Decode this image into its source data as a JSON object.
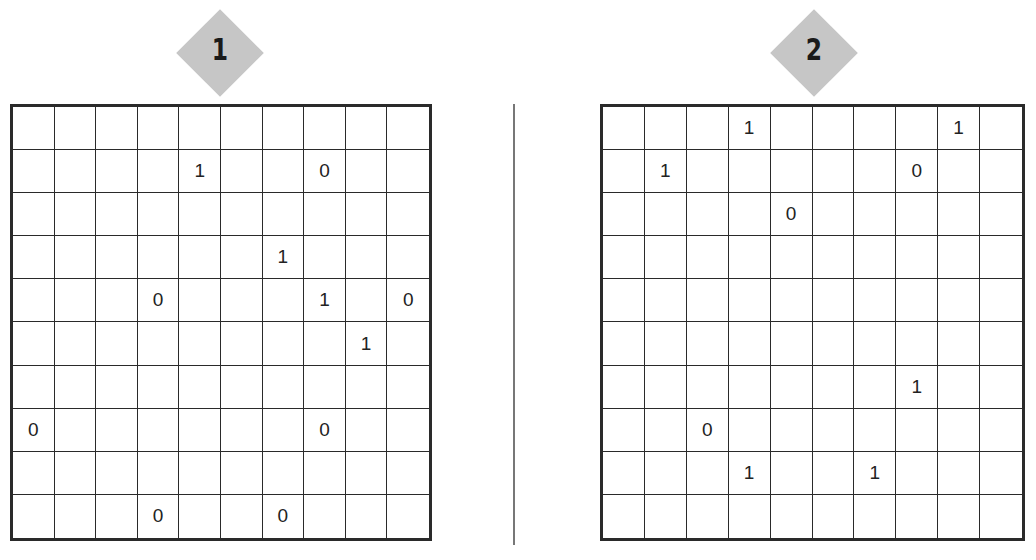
{
  "puzzles": [
    {
      "label": "1",
      "rows": 10,
      "cols": 10,
      "cells": [
        [
          "",
          "",
          "",
          "",
          "",
          "",
          "",
          "",
          "",
          ""
        ],
        [
          "",
          "",
          "",
          "",
          "1",
          "",
          "",
          "0",
          "",
          ""
        ],
        [
          "",
          "",
          "",
          "",
          "",
          "",
          "",
          "",
          "",
          ""
        ],
        [
          "",
          "",
          "",
          "",
          "",
          "",
          "1",
          "",
          "",
          ""
        ],
        [
          "",
          "",
          "",
          "0",
          "",
          "",
          "",
          "1",
          "",
          "0"
        ],
        [
          "",
          "",
          "",
          "",
          "",
          "",
          "",
          "",
          "1",
          ""
        ],
        [
          "",
          "",
          "",
          "",
          "",
          "",
          "",
          "",
          "",
          ""
        ],
        [
          "0",
          "",
          "",
          "",
          "",
          "",
          "",
          "0",
          "",
          ""
        ],
        [
          "",
          "",
          "",
          "",
          "",
          "",
          "",
          "",
          "",
          ""
        ],
        [
          "",
          "",
          "",
          "0",
          "",
          "",
          "0",
          "",
          "",
          ""
        ]
      ]
    },
    {
      "label": "2",
      "rows": 10,
      "cols": 10,
      "cells": [
        [
          "",
          "",
          "",
          "1",
          "",
          "",
          "",
          "",
          "1",
          ""
        ],
        [
          "",
          "1",
          "",
          "",
          "",
          "",
          "",
          "0",
          "",
          ""
        ],
        [
          "",
          "",
          "",
          "",
          "0",
          "",
          "",
          "",
          "",
          ""
        ],
        [
          "",
          "",
          "",
          "",
          "",
          "",
          "",
          "",
          "",
          ""
        ],
        [
          "",
          "",
          "",
          "",
          "",
          "",
          "",
          "",
          "",
          ""
        ],
        [
          "",
          "",
          "",
          "",
          "",
          "",
          "",
          "",
          "",
          ""
        ],
        [
          "",
          "",
          "",
          "",
          "",
          "",
          "",
          "1",
          "",
          ""
        ],
        [
          "",
          "",
          "0",
          "",
          "",
          "",
          "",
          "",
          "",
          ""
        ],
        [
          "",
          "",
          "",
          "1",
          "",
          "",
          "1",
          "",
          "",
          ""
        ],
        [
          "",
          "",
          "",
          "",
          "",
          "",
          "",
          "",
          "",
          ""
        ]
      ]
    }
  ],
  "colors": {
    "badge": "#c6c6c6",
    "grid_line": "#2a2a2a",
    "divider": "#777777",
    "digit": "#222222"
  }
}
